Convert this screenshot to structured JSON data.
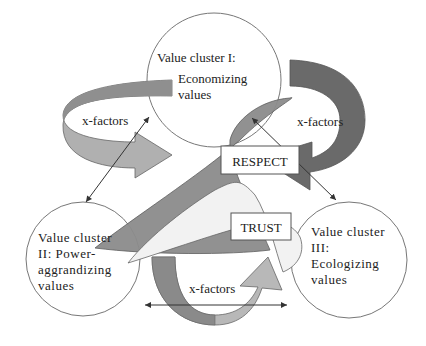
{
  "diagram": {
    "clusters": [
      {
        "id": "I",
        "lines": [
          "Value cluster I:",
          "Economizing",
          "values"
        ]
      },
      {
        "id": "II",
        "lines": [
          "Value cluster",
          "II: Power-",
          "aggrandizing",
          "values"
        ]
      },
      {
        "id": "III",
        "lines": [
          "Value cluster",
          "III:",
          "Ecologizing",
          "values"
        ]
      }
    ],
    "arrows": [
      {
        "label": "x-factors",
        "position": "top-left"
      },
      {
        "label": "x-factors",
        "position": "right"
      },
      {
        "label": "x-factors",
        "position": "bottom"
      }
    ],
    "boxes": {
      "respect": "RESPECT",
      "trust": "TRUST"
    },
    "colors": {
      "dark_gray": "#6e6e6e",
      "mid_gray": "#9a9a9a",
      "light_gray": "#c4c4c4",
      "pale": "#f0f0f0",
      "stroke": "#555555"
    }
  }
}
